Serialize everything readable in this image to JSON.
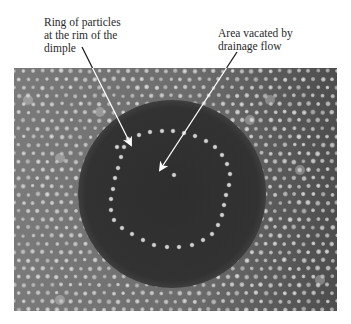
{
  "figure": {
    "annotations": [
      {
        "id": "ring",
        "text": "Ring of particles\nat the rim of the\ndimple",
        "arrow": {
          "from": [
            82,
            47
          ],
          "to": [
            131,
            145
          ]
        }
      },
      {
        "id": "area",
        "text": "Area vacated by\ndrainage flow",
        "arrow": {
          "from": [
            237,
            52
          ],
          "to": [
            160,
            170
          ]
        }
      }
    ],
    "micrograph": {
      "bounds": {
        "x": 14,
        "y": 68,
        "width": 323,
        "height": 243
      },
      "background_color": "#6f6f6f",
      "particle_color": "#d4d4d4",
      "lattice_spacing": 9.5,
      "dimple": {
        "cx": 172,
        "cy": 194,
        "r": 94,
        "color": "#2f2f2f"
      },
      "ring_particles": [
        [
          128,
          139
        ],
        [
          139,
          135
        ],
        [
          150,
          132
        ],
        [
          162,
          131
        ],
        [
          173,
          131
        ],
        [
          184,
          133
        ],
        [
          195,
          136
        ],
        [
          206,
          141
        ],
        [
          215,
          147
        ],
        [
          222,
          155
        ],
        [
          227,
          164
        ],
        [
          230,
          174
        ],
        [
          229,
          185
        ],
        [
          226,
          195
        ],
        [
          224,
          205
        ],
        [
          222,
          215
        ],
        [
          218,
          225
        ],
        [
          212,
          234
        ],
        [
          203,
          240
        ],
        [
          192,
          245
        ],
        [
          179,
          247
        ],
        [
          167,
          247
        ],
        [
          154,
          245
        ],
        [
          143,
          240
        ],
        [
          132,
          234
        ],
        [
          122,
          228
        ],
        [
          114,
          220
        ],
        [
          111,
          210
        ],
        [
          111,
          199
        ],
        [
          113,
          189
        ],
        [
          115,
          178
        ],
        [
          118,
          168
        ],
        [
          121,
          157
        ],
        [
          124,
          147
        ],
        [
          117,
          147
        ],
        [
          174,
          175
        ]
      ]
    }
  }
}
